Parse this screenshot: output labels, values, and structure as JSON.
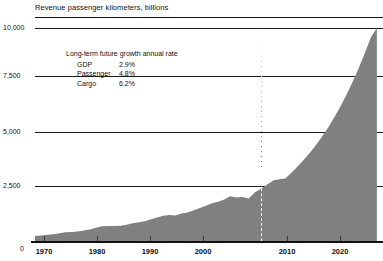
{
  "chart_data": {
    "type": "area",
    "title": "Revenue passenger kilometers, billions",
    "xlabel": "",
    "ylabel": "",
    "xlim": [
      1968,
      2025
    ],
    "ylim": [
      0,
      10000
    ],
    "ytick_labels": [
      "0",
      "2,500",
      "5,000",
      "7,500",
      "10,000"
    ],
    "ytick_values": [
      0,
      2500,
      5000,
      7500,
      10000
    ],
    "xtick_labels": [
      "1970",
      "1980",
      "1990",
      "2000",
      "2010",
      "2020"
    ],
    "xtick_values": [
      1970,
      1980,
      1990,
      2000,
      2010,
      2020
    ],
    "grid": true,
    "legend": "none",
    "series_color": "#808080",
    "x": [
      1968,
      1969,
      1970,
      1971,
      1972,
      1973,
      1974,
      1975,
      1976,
      1977,
      1978,
      1979,
      1980,
      1981,
      1982,
      1983,
      1984,
      1985,
      1986,
      1987,
      1988,
      1989,
      1990,
      1991,
      1992,
      1993,
      1994,
      1995,
      1996,
      1997,
      1998,
      1999,
      2000,
      2001,
      2002,
      2003,
      2004,
      2005,
      2006,
      2007,
      2008,
      2009,
      2010,
      2011,
      2012,
      2013,
      2014,
      2015,
      2016,
      2017,
      2018,
      2019,
      2020,
      2021,
      2022,
      2023,
      2024
    ],
    "values": [
      230,
      260,
      290,
      320,
      365,
      405,
      425,
      450,
      495,
      545,
      620,
      690,
      700,
      705,
      720,
      765,
      830,
      880,
      930,
      1020,
      1105,
      1180,
      1215,
      1195,
      1290,
      1340,
      1440,
      1545,
      1660,
      1770,
      1840,
      1950,
      2100,
      2040,
      2060,
      2000,
      2280,
      2450,
      2640,
      2840,
      2900,
      2930,
      3200,
      3500,
      3800,
      4130,
      4500,
      4900,
      5320,
      5800,
      6300,
      6850,
      7450,
      8100,
      8800,
      9550,
      10000
    ],
    "annotation": {
      "title": "Long-term future growth annual rate",
      "rows": [
        {
          "label": "GDP",
          "value": "2.9%"
        },
        {
          "label": "Passenger",
          "value": "4.8%"
        },
        {
          "label": "Cargo",
          "value": "6.2%"
        }
      ]
    },
    "forecast_marker": {
      "year": 2005,
      "style": "dashed-vertical"
    }
  }
}
